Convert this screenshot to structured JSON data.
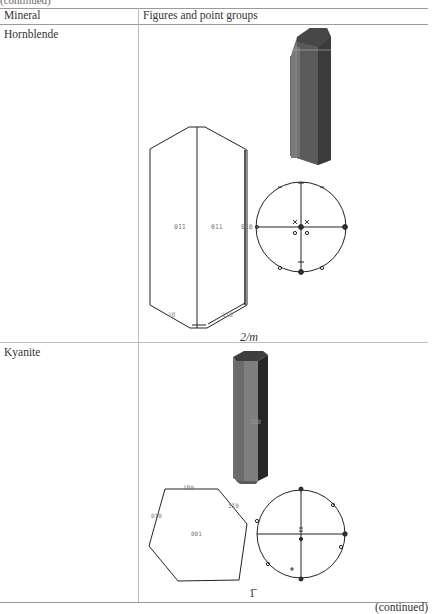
{
  "header": {
    "continued_top": "(continued)",
    "columns": [
      "Mineral",
      "Figures and point groups"
    ]
  },
  "rows": [
    {
      "mineral": "Hornblende",
      "point_group": "2/m",
      "face_labels": [
        "0̄1̄1",
        "011",
        "010",
        "1̄0",
        "110"
      ]
    },
    {
      "mineral": "Kyanite",
      "point_group": "1̄",
      "prism_label": "100",
      "face_labels": [
        "̄1̄00",
        "010",
        "1̄10",
        "001"
      ]
    }
  ],
  "footer": {
    "continued_bottom": "(continued)"
  }
}
